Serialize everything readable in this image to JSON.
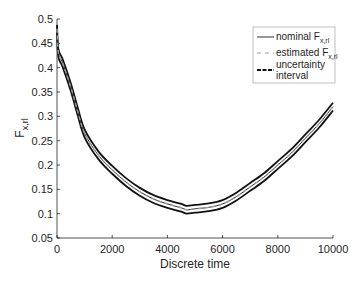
{
  "chart_data": {
    "type": "line",
    "title": "",
    "xlabel": "Discrete time",
    "ylabel": "F",
    "ylabel_subscript": "x,rl",
    "xlim": [
      0,
      10000
    ],
    "ylim": [
      0.05,
      0.5
    ],
    "grid": false,
    "legend_position": "upper right",
    "x_ticks": [
      "0",
      "2000",
      "4000",
      "6000",
      "8000",
      "10000"
    ],
    "y_ticks": [
      "0.05",
      "0.1",
      "0.15",
      "0.2",
      "0.25",
      "0.3",
      "0.35",
      "0.4",
      "0.45",
      "0.5"
    ],
    "x": [
      0,
      50,
      200,
      500,
      750,
      1000,
      1500,
      2000,
      2500,
      3000,
      3500,
      4000,
      4500,
      4700,
      5000,
      5500,
      6000,
      6500,
      7000,
      7500,
      8000,
      8500,
      9000,
      9500,
      10000
    ],
    "series": [
      {
        "name": "nominal F_x,rl",
        "style": "solid",
        "color": "#333333",
        "values": [
          0.48,
          0.43,
          0.41,
          0.36,
          0.31,
          0.265,
          0.22,
          0.19,
          0.165,
          0.145,
          0.13,
          0.12,
          0.112,
          0.108,
          0.11,
          0.113,
          0.12,
          0.135,
          0.155,
          0.175,
          0.2,
          0.225,
          0.255,
          0.285,
          0.32
        ]
      },
      {
        "name": "estimated F_x,rl",
        "style": "dashed",
        "color": "#999999",
        "values": [
          0.48,
          0.43,
          0.41,
          0.36,
          0.31,
          0.265,
          0.22,
          0.19,
          0.165,
          0.145,
          0.13,
          0.12,
          0.112,
          0.108,
          0.11,
          0.113,
          0.12,
          0.135,
          0.155,
          0.175,
          0.2,
          0.225,
          0.255,
          0.285,
          0.32
        ]
      },
      {
        "name": "uncertainty interval",
        "style": "dashed-bold",
        "color": "#111111",
        "upper": [
          0.488,
          0.438,
          0.418,
          0.368,
          0.318,
          0.273,
          0.228,
          0.198,
          0.173,
          0.153,
          0.138,
          0.128,
          0.12,
          0.116,
          0.118,
          0.121,
          0.128,
          0.143,
          0.163,
          0.183,
          0.208,
          0.233,
          0.263,
          0.293,
          0.328
        ],
        "lower": [
          0.472,
          0.422,
          0.402,
          0.352,
          0.302,
          0.257,
          0.212,
          0.182,
          0.157,
          0.137,
          0.122,
          0.112,
          0.104,
          0.1,
          0.102,
          0.105,
          0.112,
          0.127,
          0.147,
          0.167,
          0.192,
          0.217,
          0.247,
          0.277,
          0.312
        ]
      }
    ]
  },
  "legend": {
    "items": [
      {
        "label": "nominal F",
        "sub": "x,rl"
      },
      {
        "label": "estimated F",
        "sub": "x,rl"
      },
      {
        "label": "uncertainty",
        "label2": "interval"
      }
    ]
  },
  "axes": {
    "xlabel": "Discrete time",
    "ylabel_main": "F",
    "ylabel_sub": "x,rl"
  }
}
